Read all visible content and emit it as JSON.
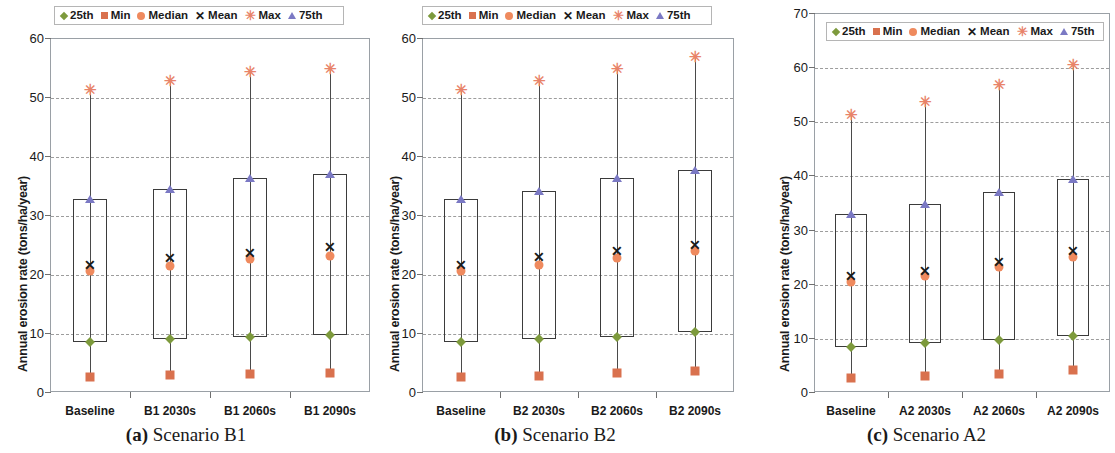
{
  "figure": {
    "ylabel": "Annual erosion rate (tons/ha/year)",
    "legend": [
      {
        "key": "p25",
        "label": "25th",
        "marker": "diamond",
        "color": "#7d9a3c"
      },
      {
        "key": "min",
        "label": "Min",
        "marker": "square",
        "color": "#d9714e"
      },
      {
        "key": "median",
        "label": "Median",
        "marker": "circle",
        "color": "#ef8a5e"
      },
      {
        "key": "mean",
        "label": "Mean",
        "marker": "x",
        "color": "#1a1a1a"
      },
      {
        "key": "max",
        "label": "Max",
        "marker": "asterisk",
        "color": "#e8836a"
      },
      {
        "key": "p75",
        "label": "75th",
        "marker": "triangle",
        "color": "#7b79c4"
      }
    ]
  },
  "chart_data": [
    {
      "type": "box",
      "panel_letter": "(a)",
      "panel_title": "Scenario B1",
      "caption_prefix": "(a)",
      "caption_text": "Scenario B1",
      "ylabel": "Annual erosion rate (tons/ha/year)",
      "xlabel": "",
      "ylim": [
        0,
        60
      ],
      "yticks": [
        0,
        10,
        20,
        30,
        40,
        50,
        60
      ],
      "ytick_labels": [
        "0",
        "10",
        "20",
        "30",
        "40",
        "50",
        "60"
      ],
      "grid": true,
      "legend_position": "top-center",
      "categories": [
        "Baseline",
        "B1 2030s",
        "B1 2060s",
        "B1 2090s"
      ],
      "series": [
        {
          "name": "Min",
          "values": [
            2.5,
            2.8,
            3.0,
            3.2
          ]
        },
        {
          "name": "25th",
          "values": [
            8.4,
            8.9,
            9.4,
            9.6
          ]
        },
        {
          "name": "Median",
          "values": [
            20.5,
            21.4,
            22.6,
            23.0
          ]
        },
        {
          "name": "Mean",
          "values": [
            21.6,
            22.7,
            23.6,
            24.6
          ]
        },
        {
          "name": "75th",
          "values": [
            32.7,
            34.4,
            36.2,
            37.0
          ]
        },
        {
          "name": "Max",
          "values": [
            51.4,
            52.8,
            54.4,
            55.0
          ]
        }
      ]
    },
    {
      "type": "box",
      "panel_letter": "(b)",
      "panel_title": "Scenario B2",
      "caption_prefix": "(b)",
      "caption_text": "Scenario B2",
      "ylabel": "Annual erosion rate (tons/ha/year)",
      "xlabel": "",
      "ylim": [
        0,
        60
      ],
      "yticks": [
        0,
        10,
        20,
        30,
        40,
        50,
        60
      ],
      "ytick_labels": [
        "0",
        "10",
        "20",
        "30",
        "40",
        "50",
        "60"
      ],
      "grid": true,
      "legend_position": "top-center",
      "categories": [
        "Baseline",
        "B2 2030s",
        "B2 2060s",
        "B2 2090s"
      ],
      "series": [
        {
          "name": "Min",
          "values": [
            2.5,
            2.7,
            3.3,
            3.6
          ]
        },
        {
          "name": "25th",
          "values": [
            8.4,
            8.9,
            9.4,
            10.1
          ]
        },
        {
          "name": "Median",
          "values": [
            20.5,
            21.6,
            22.7,
            23.9
          ]
        },
        {
          "name": "Mean",
          "values": [
            21.6,
            22.8,
            23.9,
            24.9
          ]
        },
        {
          "name": "75th",
          "values": [
            32.7,
            34.1,
            36.2,
            37.7
          ]
        },
        {
          "name": "Max",
          "values": [
            51.4,
            52.9,
            55.0,
            57.0
          ]
        }
      ]
    },
    {
      "type": "box",
      "panel_letter": "(c)",
      "panel_title": "Scenario A2",
      "caption_prefix": "(c)",
      "caption_text": "Scenario A2",
      "ylabel": "Annual erosion rate (tons/ha/year)",
      "xlabel": "",
      "ylim": [
        0,
        70
      ],
      "yticks": [
        0,
        10,
        20,
        30,
        40,
        50,
        60,
        70
      ],
      "ytick_labels": [
        "0",
        "10",
        "20",
        "30",
        "40",
        "50",
        "60",
        "70"
      ],
      "grid": true,
      "legend_position": "top-center",
      "categories": [
        "Baseline",
        "A2 2030s",
        "A2 2060s",
        "A2 2090s"
      ],
      "series": [
        {
          "name": "Min",
          "values": [
            2.5,
            2.9,
            3.4,
            4.1
          ]
        },
        {
          "name": "25th",
          "values": [
            8.4,
            9.0,
            9.6,
            10.3
          ]
        },
        {
          "name": "Median",
          "values": [
            20.4,
            21.4,
            23.1,
            25.0
          ]
        },
        {
          "name": "Mean",
          "values": [
            21.4,
            22.4,
            24.0,
            26.1
          ]
        },
        {
          "name": "75th",
          "values": [
            32.8,
            34.8,
            37.0,
            39.3
          ]
        },
        {
          "name": "Max",
          "values": [
            51.4,
            53.8,
            56.8,
            60.6
          ]
        }
      ]
    }
  ]
}
